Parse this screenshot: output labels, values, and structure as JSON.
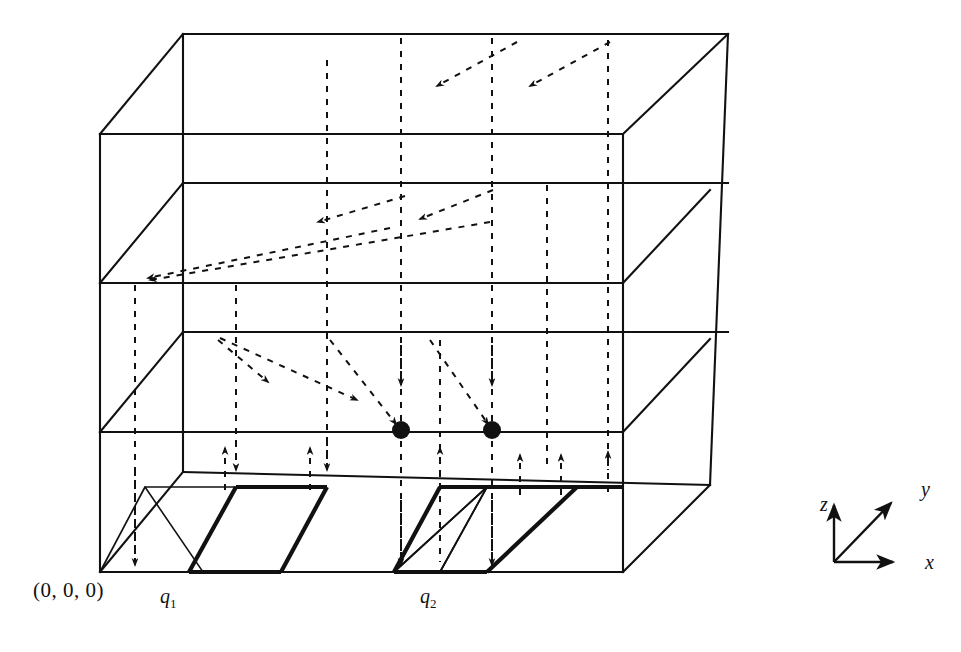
{
  "figure": {
    "kind": "3d-grid-diagram",
    "background_color": "#ffffff",
    "line_color": "#111111",
    "labels": {
      "origin": "(0, 0, 0)",
      "cell_1": "q",
      "cell_1_sub": "1",
      "cell_2": "q",
      "cell_2_sub": "2",
      "axis_z": "z",
      "axis_y": "y",
      "axis_x": "x"
    },
    "axis_legend": {
      "origin_px": [
        834,
        562
      ],
      "z_tip": [
        834,
        505
      ],
      "y_tip": [
        893,
        501
      ],
      "x_tip": [
        893,
        562
      ]
    },
    "box": {
      "front_top_left": [
        100,
        134
      ],
      "front_top_right": [
        623,
        134
      ],
      "front_bottom_left": [
        100,
        572
      ],
      "front_bottom_right": [
        623,
        572
      ],
      "back_top_left": [
        183,
        34
      ],
      "back_top_right": [
        728,
        34
      ],
      "back_bottom_left": [
        183,
        472
      ],
      "back_bottom_right": [
        710,
        485
      ],
      "depth_dx": 86,
      "depth_dy": -87,
      "layer_y": [
        134,
        283,
        432,
        572
      ]
    },
    "marked_dots": [
      {
        "cx": 401,
        "cy": 430,
        "r": 9
      },
      {
        "cx": 492,
        "cy": 430,
        "r": 9
      }
    ],
    "highlight_cells": [
      {
        "name": "q1",
        "bold": true
      },
      {
        "name": "q2",
        "bold": true
      }
    ],
    "grid_x_positions": [
      100,
      236,
      327,
      401,
      492,
      547,
      623
    ],
    "arrow_counts": {
      "layer_top_diagonal": 2,
      "layer_second_diagonal": 2,
      "layer_third_diagonal": 3,
      "vertical_down": 6,
      "vertical_up": 6
    }
  }
}
